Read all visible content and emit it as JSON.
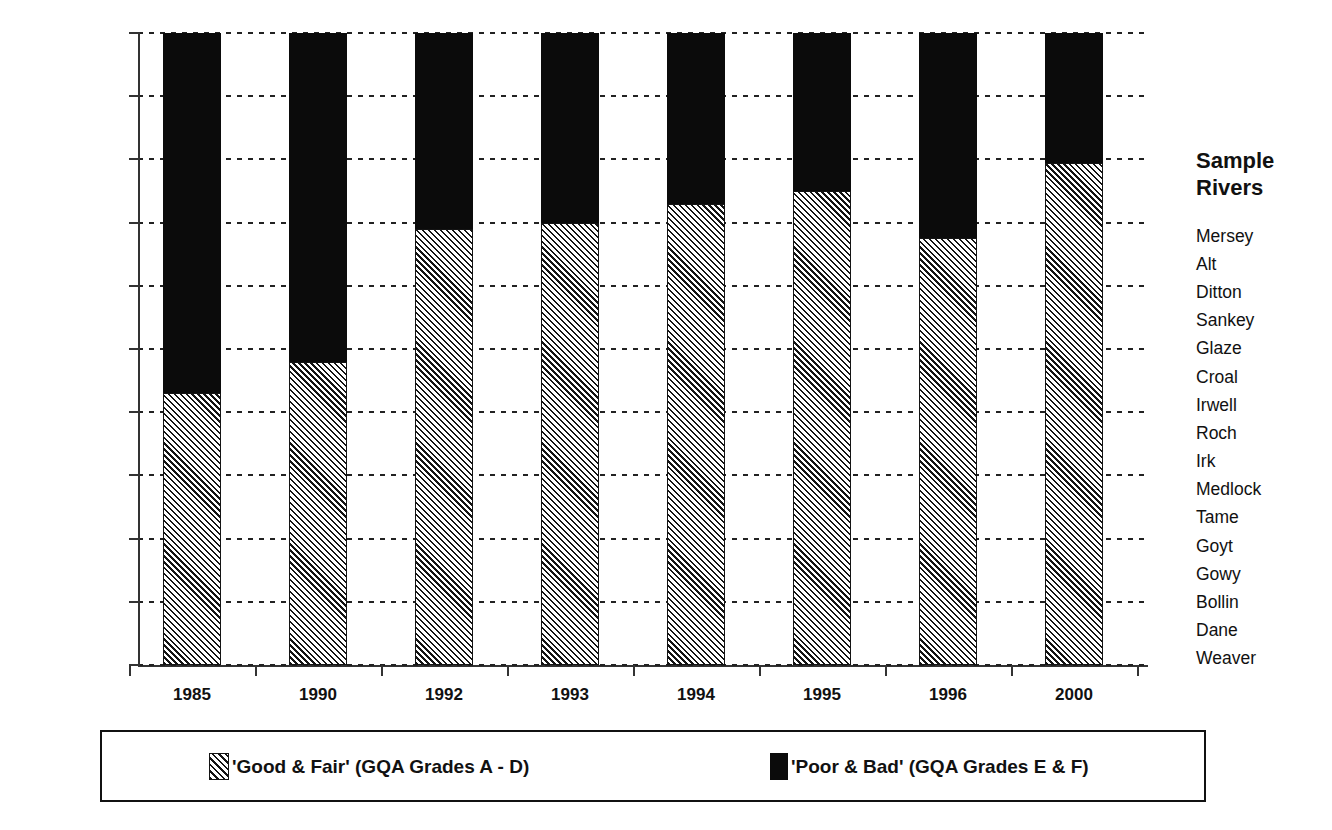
{
  "chart_data": {
    "type": "bar",
    "subtype": "stacked-bar-100-percent",
    "title": "",
    "xlabel": "",
    "ylabel": "% of River Length in Category",
    "ylim": [
      0,
      100
    ],
    "ytick_labels": [
      "100%",
      "90%",
      "80%",
      "70%",
      "60%",
      "50%",
      "40%",
      "30%",
      "20%",
      "10%",
      "0%"
    ],
    "ytick_values": [
      100,
      90,
      80,
      70,
      60,
      50,
      40,
      30,
      20,
      10,
      0
    ],
    "grid": true,
    "grid_style": "dotted-horizontal",
    "legend_position": "bottom",
    "categories": [
      "1985",
      "1990",
      "1992",
      "1993",
      "1994",
      "1995",
      "1996",
      "2000"
    ],
    "series": [
      {
        "name": "'Good & Fair' (GQA Grades A - D)",
        "pattern": "diagonal-hatch",
        "color": "#141414",
        "values": [
          43,
          48,
          69,
          70,
          73,
          75,
          67.5,
          79.5
        ]
      },
      {
        "name": "'Poor & Bad' (GQA Grades E & F)",
        "pattern": "solid",
        "color": "#0b0b0b",
        "values": [
          57,
          52,
          31,
          30,
          27,
          25,
          32.5,
          20.5
        ]
      }
    ]
  },
  "legend": {
    "items": [
      {
        "label": "'Good & Fair' (GQA Grades A - D)",
        "swatch": "hatch-swatch"
      },
      {
        "label": "'Poor & Bad' (GQA Grades E & F)",
        "swatch": "solid-black-swatch"
      }
    ]
  },
  "sidebar": {
    "title_line1": "Sample",
    "title_line2": "Rivers",
    "rivers": [
      "Mersey",
      "Alt",
      "Ditton",
      "Sankey",
      "Glaze",
      "Croal",
      "Irwell",
      "Roch",
      "Irk",
      "Medlock",
      "Tame",
      "Goyt",
      "Gowy",
      "Bollin",
      "Dane",
      "Weaver"
    ]
  }
}
